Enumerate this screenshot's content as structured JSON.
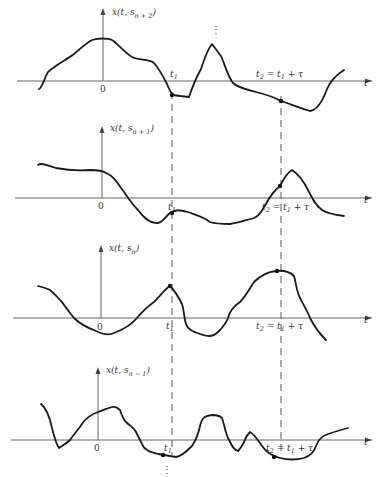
{
  "diagram": {
    "type": "random-process-sample-functions",
    "panels": [
      {
        "id": "n+2",
        "ylabel": "x(t, s",
        "ylabel_sub": "n + 2",
        "ylabel_close": ")",
        "origin_label": "0",
        "t1_label": "t",
        "t1_sub": "1",
        "t2_label": "t",
        "t2_sub": "2",
        "t2_rest": " = t",
        "t2_rest_sub": "1",
        "t2_tail": " + τ",
        "taxis_label": "t"
      },
      {
        "id": "n+1",
        "ylabel": "x(t, s",
        "ylabel_sub": "n + 1",
        "ylabel_close": ")",
        "origin_label": "0",
        "t1_label": "t",
        "t1_sub": "1",
        "t2_label": "t",
        "t2_sub": "2",
        "t2_rest": " = t",
        "t2_rest_sub": "1",
        "t2_tail": " + τ",
        "taxis_label": "t"
      },
      {
        "id": "n",
        "ylabel": "x(t, s",
        "ylabel_sub": "n",
        "ylabel_close": ")",
        "origin_label": "0",
        "t1_label": "t",
        "t1_sub": "1",
        "t2_label": "t",
        "t2_sub": "2",
        "t2_rest": " = t",
        "t2_rest_sub": "1",
        "t2_tail": " + τ",
        "taxis_label": "t"
      },
      {
        "id": "n-1",
        "ylabel": "x(t, s",
        "ylabel_sub": "n − 1",
        "ylabel_close": ")",
        "origin_label": "0",
        "t1_label": "t",
        "t1_sub": "1",
        "t2_label": "t",
        "t2_sub": "2",
        "t2_rest": " = t",
        "t2_rest_sub": "1",
        "t2_tail": " + τ",
        "taxis_label": "t"
      }
    ],
    "ellipsis_top": "⋮",
    "ellipsis_bottom": "⋮"
  }
}
